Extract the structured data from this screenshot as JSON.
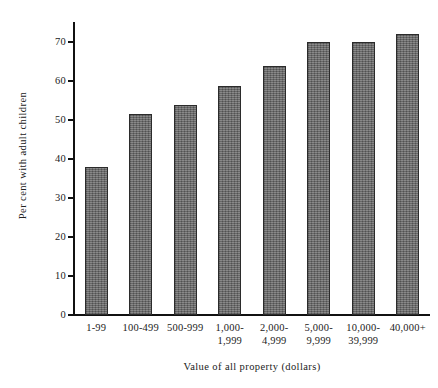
{
  "chart_data": {
    "type": "bar",
    "title": "",
    "xlabel": "Value of all property (dollars)",
    "ylabel": "Per cent with adult children",
    "categories": [
      "1-99",
      "100-499",
      "500-999",
      "1,000-\n1,999",
      "2,000-\n4,999",
      "5,000-\n9,999",
      "10,000-\n39,999",
      "40,000+"
    ],
    "category_lines": [
      [
        "1-99"
      ],
      [
        "100-499"
      ],
      [
        "500-999"
      ],
      [
        "1,000-",
        "1,999"
      ],
      [
        "2,000-",
        "4,999"
      ],
      [
        "5,000-",
        "9,999"
      ],
      [
        "10,000-",
        "39,999"
      ],
      [
        "40,000+"
      ]
    ],
    "values": [
      38,
      51.5,
      53.8,
      58.6,
      63.8,
      70,
      69.8,
      72
    ],
    "ylim": [
      0,
      75
    ],
    "yticks": [
      0,
      10,
      20,
      30,
      40,
      50,
      60,
      70
    ],
    "ytick_labels": [
      "0",
      "10",
      "20",
      "30",
      "40",
      "50",
      "60",
      "70"
    ],
    "grid": false,
    "legend": false,
    "bar_color": "#6f6f6f",
    "bar_border_color": "#2b2b2b",
    "axis_color": "#111111",
    "background_color": "#ffffff"
  }
}
